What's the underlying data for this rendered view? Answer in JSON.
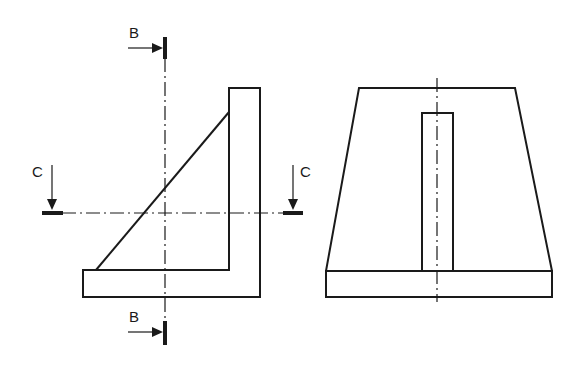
{
  "figure": {
    "type": "engineering-drawing",
    "views": [
      {
        "name": "side-view",
        "description": "L-bracket with triangular gusset"
      },
      {
        "name": "front-view",
        "description": "Trapezoidal plate with central rib on base"
      }
    ],
    "section_markers": {
      "B_top": {
        "label": "B",
        "direction": "right"
      },
      "B_bottom": {
        "label": "B",
        "direction": "right"
      },
      "C_left": {
        "label": "C",
        "direction": "down"
      },
      "C_right": {
        "label": "C",
        "direction": "down"
      }
    },
    "colors": {
      "line": "#1a1a1a",
      "background": "#ffffff"
    }
  }
}
